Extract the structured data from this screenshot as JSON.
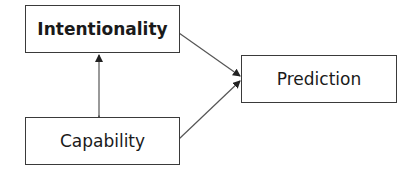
{
  "diagram": {
    "nodes": [
      {
        "id": "intentionality",
        "label": "Intentionality",
        "bold": true
      },
      {
        "id": "capability",
        "label": "Capability",
        "bold": false
      },
      {
        "id": "prediction",
        "label": "Prediction",
        "bold": false
      }
    ],
    "edges": [
      {
        "from": "intentionality",
        "to": "capability",
        "type": "bidirectional"
      },
      {
        "from": "intentionality",
        "to": "prediction",
        "type": "directed"
      },
      {
        "from": "capability",
        "to": "prediction",
        "type": "directed"
      }
    ],
    "colors": {
      "stroke": "#3a3a3a",
      "text": "#1a1a1a",
      "background": "#ffffff"
    }
  }
}
